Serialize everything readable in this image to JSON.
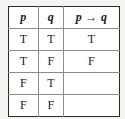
{
  "table": {
    "title": "Truth table for implication",
    "columns": [
      {
        "id": "p",
        "label": "p",
        "style": "italic-bold"
      },
      {
        "id": "q",
        "label": "q",
        "style": "italic-bold"
      },
      {
        "id": "implication",
        "label": "p → q",
        "operand_left": "p",
        "operator": "→",
        "operand_right": "q",
        "style": "italic-bold"
      }
    ],
    "rows": [
      {
        "p": "T",
        "q": "T",
        "implication": "T"
      },
      {
        "p": "T",
        "q": "F",
        "implication": "F"
      },
      {
        "p": "F",
        "q": "T",
        "implication": ""
      },
      {
        "p": "F",
        "q": "F",
        "implication": ""
      }
    ]
  },
  "colors": {
    "page_background": "#f4f4f2",
    "cell_background": "#ffffff",
    "outer_border": "#2a2a2a",
    "inner_grid": "#8c8c8c",
    "text": "#1c1c1c"
  }
}
